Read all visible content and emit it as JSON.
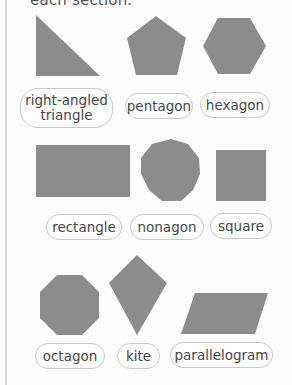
{
  "header": {
    "cutoff_text": "each section."
  },
  "colors": {
    "shape_fill": "#8c8c8c",
    "label_border": "#c9c9c9",
    "label_text": "#474747",
    "background": "#fdfdfd"
  },
  "sections": [
    {
      "shapes": [
        {
          "name": "right-angled-triangle",
          "label": "right-angled triangle"
        },
        {
          "name": "pentagon",
          "label": "pentagon"
        },
        {
          "name": "hexagon",
          "label": "hexagon"
        }
      ]
    },
    {
      "shapes": [
        {
          "name": "rectangle",
          "label": "rectangle"
        },
        {
          "name": "nonagon",
          "label": "nonagon"
        },
        {
          "name": "square",
          "label": "square"
        }
      ]
    },
    {
      "shapes": [
        {
          "name": "octagon",
          "label": "octagon"
        },
        {
          "name": "kite",
          "label": "kite"
        },
        {
          "name": "parallelogram",
          "label": "parallelogram"
        }
      ]
    }
  ]
}
